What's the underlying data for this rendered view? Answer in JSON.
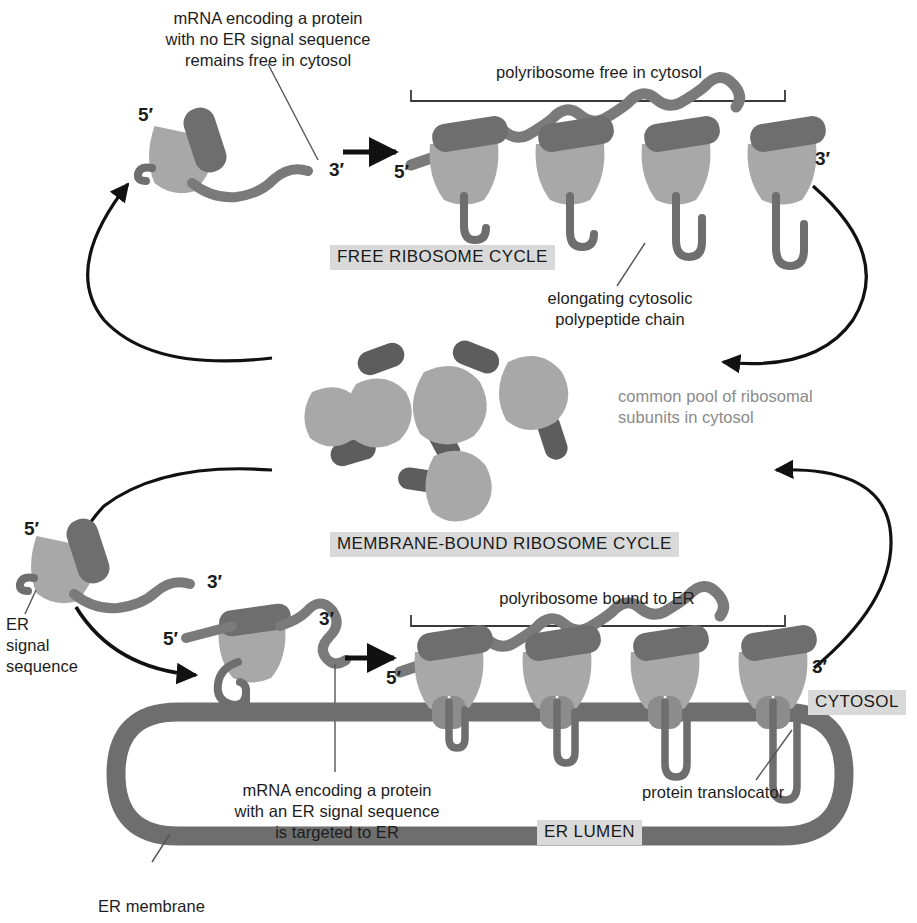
{
  "figure": {
    "colors": {
      "large_subunit": "#6e6e6e",
      "small_subunit": "#a8a8a8",
      "mrna": "#7a7a7a",
      "polypeptide": "#6e6e6e",
      "er_membrane": "#6e6e6e",
      "translocator": "#8c8c8c",
      "arrow": "#111111",
      "leader_line": "#555555",
      "highlight_bg": "#d9d9d9",
      "text": "#1c1c1c",
      "grey_text": "#8a8a8a"
    }
  },
  "labels": {
    "mrna_no_signal": "mRNA encoding a protein\nwith no ER signal sequence\nremains free in cytosol",
    "polyribosome_free": "polyribosome free in cytosol",
    "free_ribosome_cycle": "FREE RIBOSOME CYCLE",
    "elongating_chain": "elongating cytosolic\npolypeptide chain",
    "common_pool": "common pool of ribosomal\nsubunits in cytosol",
    "membrane_bound_cycle": "MEMBRANE-BOUND RIBOSOME CYCLE",
    "er_signal_sequence": "ER\nsignal\nsequence",
    "polyribosome_bound": "polyribosome bound to ER",
    "cytosol": "CYTOSOL",
    "mrna_with_signal": "mRNA encoding a protein\nwith an ER signal sequence\nis targeted to ER",
    "er_lumen": "ER LUMEN",
    "protein_translocator": "protein translocator",
    "er_membrane": "ER membrane"
  },
  "ticks": {
    "free_single_5": "5′",
    "free_single_3": "3′",
    "free_poly_5": "5′",
    "free_poly_3": "3′",
    "bound_single_5": "5′",
    "bound_single_3": "3′",
    "bound_mid_5": "5′",
    "bound_mid_3": "3′",
    "bound_poly_5": "5′",
    "bound_poly_3": "3′"
  },
  "counts": {
    "free_polyribosome_ribosomes": 4,
    "bound_polyribosome_ribosomes": 4,
    "pool_small_subunits": 6,
    "pool_large_subunits": 6
  }
}
